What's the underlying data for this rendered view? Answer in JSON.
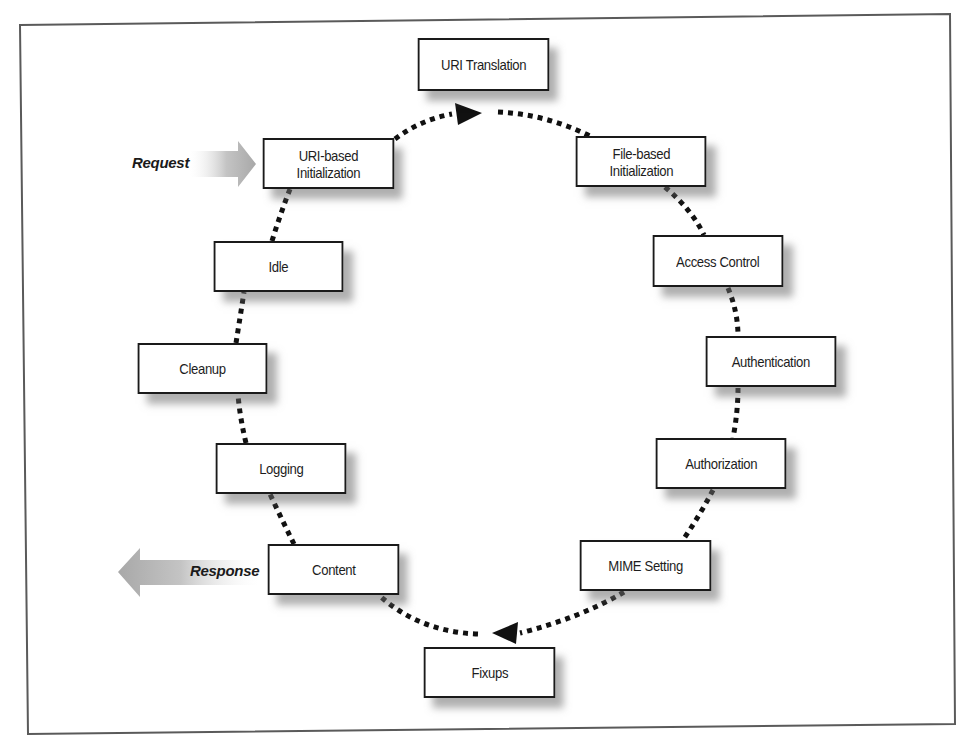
{
  "diagram": {
    "type": "request-lifecycle-cycle",
    "frame_color": "#555555",
    "box_border_color": "#1a1a1a",
    "connector_color": "#111111",
    "shadow_color": "#8a8a8a",
    "io_arrow_color": "#b4b4b4",
    "phases": [
      {
        "id": "uri-translation",
        "label": "URI Translation",
        "x": 412,
        "y": 38,
        "w": 143,
        "h": 53
      },
      {
        "id": "file-based-initialization",
        "label": "File-based\nInitialization",
        "x": 570,
        "y": 136,
        "w": 142,
        "h": 51
      },
      {
        "id": "access-control",
        "label": "Access Control",
        "x": 647,
        "y": 235,
        "w": 142,
        "h": 52
      },
      {
        "id": "authentication",
        "label": "Authentication",
        "x": 700,
        "y": 336,
        "w": 142,
        "h": 51
      },
      {
        "id": "authorization",
        "label": "Authorization",
        "x": 650,
        "y": 438,
        "w": 142,
        "h": 51
      },
      {
        "id": "mime-setting",
        "label": "MIME Setting",
        "x": 574,
        "y": 540,
        "w": 143,
        "h": 51
      },
      {
        "id": "fixups",
        "label": "Fixups",
        "x": 418,
        "y": 647,
        "w": 143,
        "h": 51
      },
      {
        "id": "content",
        "label": "Content",
        "x": 262,
        "y": 544,
        "w": 143,
        "h": 51
      },
      {
        "id": "logging",
        "label": "Logging",
        "x": 210,
        "y": 443,
        "w": 142,
        "h": 51
      },
      {
        "id": "cleanup",
        "label": "Cleanup",
        "x": 132,
        "y": 343,
        "w": 141,
        "h": 51
      },
      {
        "id": "idle",
        "label": "Idle",
        "x": 208,
        "y": 241,
        "w": 141,
        "h": 51
      },
      {
        "id": "uri-based-initialization",
        "label": "URI-based\nInitialization",
        "x": 257,
        "y": 138,
        "w": 143,
        "h": 51
      }
    ],
    "request": {
      "label": "Request",
      "direction": "in"
    },
    "response": {
      "label": "Response",
      "direction": "out"
    }
  }
}
